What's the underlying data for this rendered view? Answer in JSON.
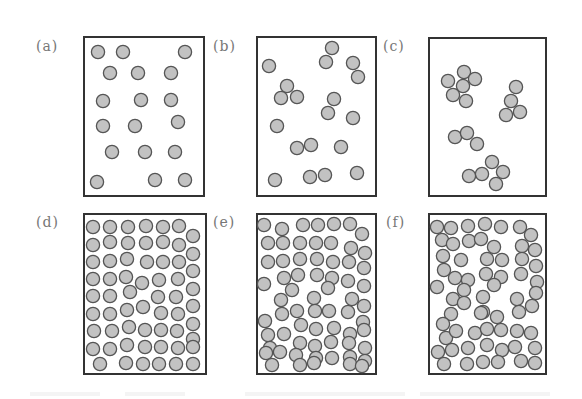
{
  "figure": {
    "particle_style": {
      "fill": "#c2c2c2",
      "stroke": "#555555",
      "radius": 6.6
    },
    "panels": [
      {
        "id": "a",
        "label": "(a)",
        "label_pos": [
          36,
          38
        ],
        "box": [
          83,
          36,
          122,
          161
        ],
        "particles": [
          [
            98,
            52
          ],
          [
            123,
            52
          ],
          [
            185,
            52
          ],
          [
            110,
            73
          ],
          [
            138,
            73
          ],
          [
            171,
            73
          ],
          [
            103,
            101
          ],
          [
            141,
            100
          ],
          [
            171,
            100
          ],
          [
            103,
            126
          ],
          [
            135,
            126
          ],
          [
            178,
            122
          ],
          [
            112,
            152
          ],
          [
            145,
            152
          ],
          [
            175,
            152
          ],
          [
            97,
            182
          ],
          [
            155,
            180
          ],
          [
            185,
            180
          ]
        ]
      },
      {
        "id": "b",
        "label": "(b)",
        "label_pos": [
          213,
          38
        ],
        "box": [
          256,
          36,
          121,
          161
        ],
        "particles": [
          [
            332,
            48
          ],
          [
            326,
            62
          ],
          [
            353,
            63
          ],
          [
            358,
            77
          ],
          [
            269,
            66
          ],
          [
            287,
            86
          ],
          [
            281,
            98
          ],
          [
            297,
            97
          ],
          [
            334,
            99
          ],
          [
            328,
            113
          ],
          [
            353,
            118
          ],
          [
            277,
            126
          ],
          [
            297,
            148
          ],
          [
            311,
            145
          ],
          [
            341,
            147
          ],
          [
            275,
            180
          ],
          [
            310,
            177
          ],
          [
            325,
            175
          ],
          [
            357,
            173
          ]
        ]
      },
      {
        "id": "c",
        "label": "(c)",
        "label_pos": [
          383,
          38
        ],
        "box": [
          428,
          37,
          119,
          160
        ],
        "particles": [
          [
            464,
            72
          ],
          [
            448,
            81
          ],
          [
            475,
            79
          ],
          [
            463,
            86
          ],
          [
            453,
            95
          ],
          [
            466,
            101
          ],
          [
            516,
            87
          ],
          [
            511,
            101
          ],
          [
            506,
            115
          ],
          [
            520,
            112
          ],
          [
            455,
            137
          ],
          [
            467,
            133
          ],
          [
            477,
            144
          ],
          [
            492,
            162
          ],
          [
            482,
            174
          ],
          [
            503,
            172
          ],
          [
            496,
            184
          ],
          [
            469,
            176
          ]
        ]
      },
      {
        "id": "d",
        "label": "(d)",
        "label_pos": [
          36,
          214
        ],
        "box": [
          83,
          213,
          124,
          162
        ],
        "particles": [
          [
            93,
            227
          ],
          [
            110,
            227
          ],
          [
            128,
            227
          ],
          [
            146,
            226
          ],
          [
            163,
            227
          ],
          [
            179,
            226
          ],
          [
            193,
            236
          ],
          [
            93,
            245
          ],
          [
            110,
            242
          ],
          [
            128,
            243
          ],
          [
            146,
            243
          ],
          [
            163,
            242
          ],
          [
            179,
            245
          ],
          [
            193,
            254
          ],
          [
            93,
            262
          ],
          [
            110,
            261
          ],
          [
            127,
            259
          ],
          [
            147,
            262
          ],
          [
            163,
            262
          ],
          [
            179,
            262
          ],
          [
            193,
            271
          ],
          [
            93,
            279
          ],
          [
            110,
            279
          ],
          [
            126,
            277
          ],
          [
            142,
            283
          ],
          [
            159,
            280
          ],
          [
            178,
            279
          ],
          [
            193,
            289
          ],
          [
            93,
            296
          ],
          [
            110,
            296
          ],
          [
            130,
            292
          ],
          [
            158,
            297
          ],
          [
            176,
            297
          ],
          [
            193,
            306
          ],
          [
            93,
            314
          ],
          [
            110,
            314
          ],
          [
            127,
            310
          ],
          [
            143,
            307
          ],
          [
            161,
            313
          ],
          [
            178,
            314
          ],
          [
            193,
            324
          ],
          [
            94,
            331
          ],
          [
            112,
            331
          ],
          [
            129,
            327
          ],
          [
            145,
            330
          ],
          [
            161,
            330
          ],
          [
            177,
            331
          ],
          [
            193,
            339
          ],
          [
            93,
            349
          ],
          [
            110,
            349
          ],
          [
            127,
            345
          ],
          [
            145,
            347
          ],
          [
            161,
            347
          ],
          [
            178,
            348
          ],
          [
            193,
            347
          ],
          [
            100,
            364
          ],
          [
            126,
            363
          ],
          [
            143,
            364
          ],
          [
            159,
            364
          ],
          [
            176,
            364
          ],
          [
            193,
            364
          ]
        ]
      },
      {
        "id": "e",
        "label": "(e)",
        "label_pos": [
          213,
          214
        ],
        "box": [
          256,
          213,
          121,
          162
        ],
        "particles": [
          [
            264,
            225
          ],
          [
            282,
            229
          ],
          [
            303,
            225
          ],
          [
            318,
            225
          ],
          [
            334,
            224
          ],
          [
            350,
            224
          ],
          [
            362,
            234
          ],
          [
            268,
            243
          ],
          [
            283,
            243
          ],
          [
            300,
            243
          ],
          [
            316,
            243
          ],
          [
            331,
            243
          ],
          [
            351,
            248
          ],
          [
            365,
            253
          ],
          [
            268,
            262
          ],
          [
            283,
            261
          ],
          [
            300,
            259
          ],
          [
            317,
            259
          ],
          [
            333,
            262
          ],
          [
            349,
            262
          ],
          [
            364,
            268
          ],
          [
            264,
            284
          ],
          [
            284,
            278
          ],
          [
            298,
            275
          ],
          [
            317,
            275
          ],
          [
            332,
            278
          ],
          [
            348,
            281
          ],
          [
            364,
            286
          ],
          [
            292,
            290
          ],
          [
            281,
            300
          ],
          [
            328,
            288
          ],
          [
            314,
            298
          ],
          [
            352,
            299
          ],
          [
            364,
            306
          ],
          [
            282,
            314
          ],
          [
            297,
            311
          ],
          [
            315,
            311
          ],
          [
            329,
            311
          ],
          [
            348,
            312
          ],
          [
            363,
            322
          ],
          [
            265,
            321
          ],
          [
            284,
            334
          ],
          [
            301,
            325
          ],
          [
            316,
            329
          ],
          [
            334,
            328
          ],
          [
            350,
            334
          ],
          [
            364,
            330
          ],
          [
            268,
            335
          ],
          [
            270,
            348
          ],
          [
            300,
            343
          ],
          [
            315,
            346
          ],
          [
            331,
            342
          ],
          [
            349,
            343
          ],
          [
            365,
            348
          ],
          [
            266,
            353
          ],
          [
            280,
            352
          ],
          [
            296,
            355
          ],
          [
            316,
            358
          ],
          [
            332,
            358
          ],
          [
            350,
            357
          ],
          [
            365,
            361
          ],
          [
            272,
            365
          ],
          [
            300,
            365
          ],
          [
            314,
            363
          ],
          [
            350,
            364
          ],
          [
            362,
            366
          ]
        ]
      },
      {
        "id": "f",
        "label": "(f)",
        "label_pos": [
          386,
          214
        ],
        "box": [
          428,
          213,
          119,
          162
        ],
        "particles": [
          [
            437,
            227
          ],
          [
            451,
            228
          ],
          [
            468,
            226
          ],
          [
            485,
            224
          ],
          [
            501,
            227
          ],
          [
            520,
            227
          ],
          [
            531,
            235
          ],
          [
            442,
            240
          ],
          [
            453,
            244
          ],
          [
            469,
            241
          ],
          [
            481,
            239
          ],
          [
            494,
            247
          ],
          [
            522,
            246
          ],
          [
            535,
            250
          ],
          [
            443,
            256
          ],
          [
            461,
            260
          ],
          [
            487,
            259
          ],
          [
            502,
            260
          ],
          [
            522,
            259
          ],
          [
            536,
            266
          ],
          [
            444,
            270
          ],
          [
            455,
            278
          ],
          [
            468,
            280
          ],
          [
            486,
            274
          ],
          [
            501,
            277
          ],
          [
            521,
            274
          ],
          [
            537,
            282
          ],
          [
            437,
            287
          ],
          [
            464,
            290
          ],
          [
            494,
            285
          ],
          [
            483,
            297
          ],
          [
            536,
            293
          ],
          [
            453,
            299
          ],
          [
            464,
            303
          ],
          [
            483,
            312
          ],
          [
            517,
            299
          ],
          [
            519,
            312
          ],
          [
            532,
            306
          ],
          [
            451,
            314
          ],
          [
            481,
            313
          ],
          [
            497,
            317
          ],
          [
            443,
            324
          ],
          [
            446,
            338
          ],
          [
            456,
            331
          ],
          [
            475,
            333
          ],
          [
            487,
            329
          ],
          [
            501,
            330
          ],
          [
            517,
            331
          ],
          [
            531,
            333
          ],
          [
            438,
            352
          ],
          [
            452,
            350
          ],
          [
            468,
            348
          ],
          [
            487,
            345
          ],
          [
            502,
            350
          ],
          [
            515,
            347
          ],
          [
            535,
            348
          ],
          [
            444,
            364
          ],
          [
            467,
            364
          ],
          [
            483,
            362
          ],
          [
            498,
            362
          ],
          [
            521,
            361
          ],
          [
            535,
            363
          ]
        ]
      }
    ],
    "caption_ghost": [
      [
        30,
        70
      ],
      [
        125,
        60
      ],
      [
        245,
        160
      ],
      [
        420,
        130
      ]
    ]
  }
}
